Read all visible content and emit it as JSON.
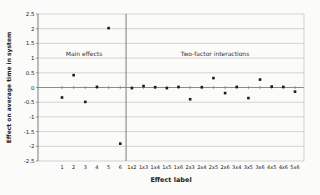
{
  "figure": {
    "y_axis_title": "Effect on average time in system",
    "x_axis_title": "Effect label",
    "annotation_main": "Main effects",
    "annotation_interactions": "Two-factor interactions"
  },
  "chart_data": {
    "type": "scatter",
    "title": "",
    "xlabel": "Effect label",
    "ylabel": "Effect on average time in system",
    "categories": [
      "1",
      "2",
      "3",
      "4",
      "5",
      "6",
      "1x2",
      "1x3",
      "1x4",
      "1x5",
      "1x6",
      "2x3",
      "2x4",
      "2x5",
      "2x6",
      "3x4",
      "3x5",
      "3x6",
      "4x5",
      "4x6",
      "5x6"
    ],
    "values": [
      -0.34,
      0.42,
      -0.49,
      0.02,
      2.02,
      -1.91,
      -0.02,
      0.05,
      0.01,
      -0.02,
      0.02,
      -0.4,
      0.01,
      0.32,
      -0.19,
      0.02,
      -0.36,
      0.27,
      0.03,
      0.02,
      -0.14
    ],
    "ylim": [
      -2.5,
      2.5
    ],
    "ytick_labels": [
      "2.5",
      "2",
      "1.5",
      "1",
      "0.5",
      "0",
      "-0.5",
      "-1",
      "-1.5",
      "-2",
      "-2.5"
    ],
    "grid": "horizontal",
    "legend": "none",
    "annotations": [
      {
        "text": "Main effects",
        "applies_to": "categories 1-6"
      },
      {
        "text": "Two-factor interactions",
        "applies_to": "categories 1x2-5x6"
      }
    ],
    "divider_after_category": "6",
    "marker": "small-black-square",
    "colors": {
      "marker": "#1a1a1a",
      "gridline": "#c2c2c0",
      "axis": "#7d7d7b",
      "text": "#222222",
      "background": "#fbfbf9"
    }
  }
}
